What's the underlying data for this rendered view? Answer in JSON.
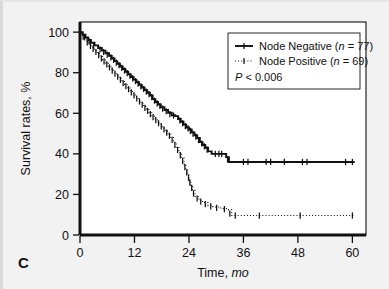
{
  "figure": {
    "panel_label": "C",
    "background_color": "#f2f2f2",
    "plot_background_color": "#ffffff",
    "frame_color": "#111111"
  },
  "chart_data": {
    "type": "line",
    "title": "",
    "subtitle": "",
    "xlabel_main": "Time,",
    "xlabel_italic": "mo",
    "ylabel": "Survival rates, %",
    "xlim": [
      0,
      63
    ],
    "ylim": [
      0,
      105
    ],
    "xticks": [
      0,
      12,
      24,
      36,
      48,
      60
    ],
    "xtick_labels": [
      "0",
      "12",
      "24",
      "36",
      "48",
      "60"
    ],
    "yticks": [
      0,
      20,
      40,
      60,
      80,
      100
    ],
    "ytick_labels": [
      "0",
      "20",
      "40",
      "60",
      "80",
      "100"
    ],
    "grid": false,
    "legend_position": "top-right",
    "annotations": [
      {
        "name": "p-value",
        "text_italic": "P",
        "text_rest": " < 0.006"
      }
    ],
    "series": [
      {
        "name": "Node Negative",
        "label": "Node Negative (n = 77)",
        "label_prefix": "Node Negative (",
        "label_italic": "n",
        "label_suffix": " = 77)",
        "n": 77,
        "style": "solid",
        "color": "#111111",
        "marker": "plus",
        "steps": [
          [
            0,
            100
          ],
          [
            0.6,
            98.7
          ],
          [
            1.2,
            97.4
          ],
          [
            1.8,
            96.1
          ],
          [
            2.4,
            94.8
          ],
          [
            3.2,
            93.5
          ],
          [
            4.0,
            92.2
          ],
          [
            4.8,
            90.9
          ],
          [
            5.6,
            89.6
          ],
          [
            6.4,
            88.3
          ],
          [
            7.0,
            87.0
          ],
          [
            7.6,
            85.7
          ],
          [
            8.2,
            84.4
          ],
          [
            8.8,
            83.1
          ],
          [
            9.4,
            81.8
          ],
          [
            10.0,
            80.5
          ],
          [
            10.6,
            79.2
          ],
          [
            11.2,
            77.9
          ],
          [
            11.8,
            76.6
          ],
          [
            12.4,
            75.3
          ],
          [
            13.0,
            74.0
          ],
          [
            13.6,
            72.7
          ],
          [
            14.2,
            71.4
          ],
          [
            14.8,
            70.1
          ],
          [
            15.4,
            68.8
          ],
          [
            16.0,
            67.0
          ],
          [
            16.6,
            65.6
          ],
          [
            17.2,
            64.3
          ],
          [
            17.8,
            63.0
          ],
          [
            18.6,
            61.6
          ],
          [
            19.4,
            60.3
          ],
          [
            20.2,
            59.0
          ],
          [
            21.0,
            58.6
          ],
          [
            21.6,
            57.2
          ],
          [
            22.2,
            55.8
          ],
          [
            22.8,
            54.4
          ],
          [
            23.4,
            53.0
          ],
          [
            24.0,
            52.0
          ],
          [
            24.6,
            50.6
          ],
          [
            25.2,
            49.2
          ],
          [
            25.8,
            47.8
          ],
          [
            26.4,
            45.8
          ],
          [
            27.0,
            44.4
          ],
          [
            27.6,
            43.0
          ],
          [
            28.2,
            41.2
          ],
          [
            29.0,
            40.0
          ],
          [
            31.5,
            40.0
          ],
          [
            32.2,
            38.4
          ],
          [
            32.8,
            36.0
          ],
          [
            60.5,
            36.0
          ]
        ],
        "censor_marks": [
          [
            1.0,
            97.4
          ],
          [
            2.0,
            95.4
          ],
          [
            3.0,
            93.5
          ],
          [
            4.4,
            91.5
          ],
          [
            5.2,
            90.2
          ],
          [
            6.0,
            88.9
          ],
          [
            6.8,
            87.6
          ],
          [
            7.4,
            86.3
          ],
          [
            8.0,
            85.0
          ],
          [
            8.6,
            83.7
          ],
          [
            9.2,
            82.4
          ],
          [
            9.8,
            81.1
          ],
          [
            10.4,
            79.8
          ],
          [
            11.0,
            78.5
          ],
          [
            11.6,
            77.2
          ],
          [
            12.2,
            75.9
          ],
          [
            12.8,
            74.6
          ],
          [
            13.4,
            73.3
          ],
          [
            14.0,
            72.0
          ],
          [
            14.6,
            70.7
          ],
          [
            15.2,
            69.4
          ],
          [
            15.8,
            68.0
          ],
          [
            16.4,
            66.2
          ],
          [
            17.0,
            64.9
          ],
          [
            17.6,
            63.6
          ],
          [
            18.2,
            62.3
          ],
          [
            19.0,
            61.0
          ],
          [
            19.8,
            59.6
          ],
          [
            20.6,
            58.9
          ],
          [
            22.0,
            56.5
          ],
          [
            22.6,
            55.1
          ],
          [
            23.2,
            53.7
          ],
          [
            23.8,
            52.6
          ],
          [
            24.3,
            51.3
          ],
          [
            24.9,
            49.9
          ],
          [
            25.5,
            48.5
          ],
          [
            26.1,
            46.8
          ],
          [
            26.8,
            45.1
          ],
          [
            27.4,
            43.7
          ],
          [
            28.0,
            42.1
          ],
          [
            29.8,
            40.0
          ],
          [
            30.6,
            40.0
          ],
          [
            31.2,
            40.0
          ],
          [
            32.5,
            37.2
          ],
          [
            36.0,
            36.0
          ],
          [
            37.0,
            36.0
          ],
          [
            41.0,
            36.0
          ],
          [
            42.0,
            36.0
          ],
          [
            45.0,
            36.0
          ],
          [
            49.0,
            36.0
          ],
          [
            50.0,
            36.0
          ],
          [
            58.5,
            36.0
          ],
          [
            60.0,
            36.0
          ]
        ]
      },
      {
        "name": "Node Positive",
        "label": "Node Positive (n = 69)",
        "label_prefix": "Node Positive (",
        "label_italic": "n",
        "label_suffix": " = 69)",
        "n": 69,
        "style": "dotted",
        "color": "#111111",
        "marker": "plus",
        "steps": [
          [
            0,
            100
          ],
          [
            0.4,
            98.5
          ],
          [
            0.9,
            97.0
          ],
          [
            1.4,
            95.5
          ],
          [
            2.0,
            94.0
          ],
          [
            2.6,
            92.4
          ],
          [
            3.2,
            90.9
          ],
          [
            3.8,
            89.4
          ],
          [
            4.4,
            87.9
          ],
          [
            5.0,
            86.3
          ],
          [
            5.6,
            84.8
          ],
          [
            6.2,
            83.3
          ],
          [
            6.8,
            81.8
          ],
          [
            7.4,
            80.2
          ],
          [
            8.0,
            78.7
          ],
          [
            8.6,
            77.2
          ],
          [
            9.2,
            75.7
          ],
          [
            9.8,
            74.1
          ],
          [
            10.4,
            72.6
          ],
          [
            11.0,
            71.1
          ],
          [
            11.6,
            69.5
          ],
          [
            12.2,
            68.0
          ],
          [
            12.8,
            66.5
          ],
          [
            13.4,
            65.0
          ],
          [
            14.0,
            63.4
          ],
          [
            14.6,
            61.9
          ],
          [
            15.2,
            60.4
          ],
          [
            15.8,
            58.8
          ],
          [
            16.4,
            57.3
          ],
          [
            17.0,
            55.8
          ],
          [
            17.6,
            54.3
          ],
          [
            18.2,
            52.7
          ],
          [
            18.8,
            51.2
          ],
          [
            19.4,
            49.7
          ],
          [
            20.0,
            48.1
          ],
          [
            20.6,
            45.6
          ],
          [
            21.2,
            43.1
          ],
          [
            21.8,
            40.6
          ],
          [
            22.4,
            38.0
          ],
          [
            22.9,
            35.0
          ],
          [
            23.3,
            32.0
          ],
          [
            23.7,
            29.5
          ],
          [
            24.0,
            27.0
          ],
          [
            24.4,
            24.5
          ],
          [
            24.8,
            22.0
          ],
          [
            25.3,
            19.0
          ],
          [
            26.2,
            17.0
          ],
          [
            27.0,
            16.0
          ],
          [
            28.2,
            14.5
          ],
          [
            29.3,
            13.8
          ],
          [
            31.0,
            13.0
          ],
          [
            32.5,
            12.5
          ],
          [
            33.4,
            9.6
          ],
          [
            60.5,
            9.6
          ]
        ],
        "censor_marks": [
          [
            0.7,
            97.8
          ],
          [
            1.6,
            95.0
          ],
          [
            2.3,
            93.2
          ],
          [
            2.9,
            91.7
          ],
          [
            3.5,
            90.2
          ],
          [
            4.1,
            88.7
          ],
          [
            4.7,
            87.1
          ],
          [
            5.3,
            85.6
          ],
          [
            5.9,
            84.1
          ],
          [
            6.5,
            82.6
          ],
          [
            7.1,
            81.0
          ],
          [
            7.7,
            79.5
          ],
          [
            8.3,
            78.0
          ],
          [
            8.9,
            76.5
          ],
          [
            9.5,
            74.9
          ],
          [
            10.1,
            73.4
          ],
          [
            10.7,
            71.9
          ],
          [
            11.3,
            70.3
          ],
          [
            11.9,
            68.8
          ],
          [
            12.5,
            67.3
          ],
          [
            13.1,
            65.8
          ],
          [
            13.7,
            64.2
          ],
          [
            14.3,
            62.7
          ],
          [
            14.9,
            61.2
          ],
          [
            15.5,
            59.6
          ],
          [
            16.1,
            58.1
          ],
          [
            16.7,
            56.6
          ],
          [
            17.3,
            55.1
          ],
          [
            17.9,
            53.5
          ],
          [
            18.5,
            52.0
          ],
          [
            19.1,
            50.5
          ],
          [
            19.7,
            48.9
          ],
          [
            20.3,
            46.9
          ],
          [
            20.9,
            44.4
          ],
          [
            21.5,
            41.9
          ],
          [
            22.1,
            39.3
          ],
          [
            22.6,
            36.5
          ],
          [
            23.1,
            33.5
          ],
          [
            23.5,
            30.8
          ],
          [
            23.9,
            28.2
          ],
          [
            24.2,
            25.8
          ],
          [
            24.6,
            23.2
          ],
          [
            25.0,
            20.5
          ],
          [
            25.8,
            18.0
          ],
          [
            26.6,
            16.5
          ],
          [
            27.6,
            15.2
          ],
          [
            28.8,
            14.1
          ],
          [
            30.1,
            13.4
          ],
          [
            31.8,
            12.8
          ],
          [
            33.0,
            10.5
          ],
          [
            34.2,
            9.6
          ],
          [
            39.5,
            9.6
          ],
          [
            48.5,
            9.6
          ],
          [
            60.0,
            9.6
          ]
        ]
      }
    ]
  },
  "legend": {
    "items": [
      {
        "style": "solid",
        "label_prefix": "Node Negative (",
        "label_italic": "n",
        "label_suffix": " = 77)"
      },
      {
        "style": "dotted",
        "label_prefix": "Node Positive (",
        "label_italic": "n",
        "label_suffix": " = 69)"
      }
    ],
    "pvalue_italic": "P",
    "pvalue_rest": " < 0.006"
  }
}
